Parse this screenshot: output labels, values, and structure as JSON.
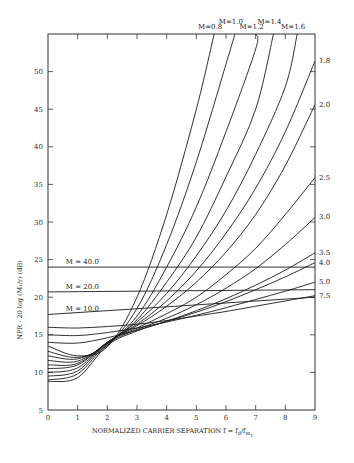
{
  "chart_data": {
    "type": "line",
    "title": "",
    "xlabel": "NORMALIZED CARRIER SEPARATION f = f_d/f_m1",
    "ylabel": "NPR - 20 log (M_1/r) (dB)",
    "xlim": [
      0,
      9
    ],
    "ylim": [
      5,
      55
    ],
    "x_ticks": [
      0,
      1,
      2,
      3,
      4,
      5,
      6,
      7,
      8,
      9
    ],
    "y_ticks": [
      5,
      10,
      15,
      20,
      25,
      30,
      35,
      40,
      45,
      50
    ],
    "grid": false,
    "legend": "inline curve labels",
    "series": [
      {
        "name": "M=0.8",
        "label_pos": "top",
        "x": [
          0,
          1,
          2,
          3,
          4,
          5,
          5.6
        ],
        "y": [
          13.5,
          12.2,
          13.4,
          20,
          31,
          45,
          55
        ]
      },
      {
        "name": "M=1.0",
        "label_pos": "top",
        "x": [
          0,
          1,
          2,
          3,
          4,
          5,
          6,
          6.3
        ],
        "y": [
          12.8,
          12.0,
          13.6,
          18.5,
          27,
          38,
          51,
          55
        ]
      },
      {
        "name": "M=1.2",
        "label_pos": "top",
        "x": [
          0,
          1,
          2,
          3,
          4,
          5,
          6,
          7,
          7.0
        ],
        "y": [
          12.2,
          11.8,
          13.8,
          17.5,
          24,
          32,
          42,
          53,
          55
        ]
      },
      {
        "name": "M=1.4",
        "label_pos": "top",
        "x": [
          0,
          1,
          2,
          3,
          4,
          5,
          6,
          7,
          7.6
        ],
        "y": [
          11.6,
          11.5,
          13.9,
          17,
          22,
          28,
          36,
          45,
          55
        ]
      },
      {
        "name": "M=1.6",
        "label_pos": "top",
        "x": [
          0,
          1,
          2,
          3,
          4,
          5,
          6,
          7,
          8,
          8.4
        ],
        "y": [
          11.0,
          11.2,
          14,
          16.7,
          20.5,
          25.5,
          31.5,
          39,
          48,
          55
        ]
      },
      {
        "name": "1.8",
        "label_pos": "right",
        "x": [
          0,
          1,
          2,
          3,
          4,
          5,
          6,
          7,
          8,
          9
        ],
        "y": [
          10.5,
          11.0,
          14,
          16.4,
          19.5,
          23.5,
          28.5,
          34.5,
          42,
          51.4
        ]
      },
      {
        "name": "2.0",
        "label_pos": "right",
        "x": [
          0,
          1,
          2,
          3,
          4,
          5,
          6,
          7,
          8,
          9
        ],
        "y": [
          10.0,
          10.6,
          14,
          16.2,
          18.8,
          22,
          26,
          31,
          37.5,
          45.6
        ]
      },
      {
        "name": "2.5",
        "label_pos": "right",
        "x": [
          0,
          1,
          2,
          3,
          4,
          5,
          6,
          7,
          8,
          9
        ],
        "y": [
          9.5,
          10.2,
          14,
          15.9,
          17.8,
          20,
          23,
          26.5,
          31,
          35.9
        ]
      },
      {
        "name": "3.0",
        "label_pos": "right",
        "x": [
          0,
          1,
          2,
          3,
          4,
          5,
          6,
          7,
          8,
          9
        ],
        "y": [
          9.0,
          9.8,
          13.8,
          15.7,
          17.2,
          19,
          21.2,
          23.8,
          27,
          30.6
        ]
      },
      {
        "name": "3.5",
        "label_pos": "right",
        "x": [
          0,
          1,
          2,
          3,
          4,
          5,
          6,
          7,
          8,
          9
        ],
        "y": [
          8.8,
          9.3,
          13.6,
          15.5,
          16.8,
          18.2,
          19.8,
          21.6,
          23.6,
          25.9
        ]
      },
      {
        "name": "4.0",
        "label_pos": "right",
        "x": [
          0,
          1,
          2,
          3,
          4,
          5,
          6,
          7,
          8,
          9
        ],
        "y": [
          14.0,
          13.9,
          14.6,
          15.6,
          16.8,
          18.0,
          19.4,
          21.0,
          22.7,
          24.6
        ]
      },
      {
        "name": "5.0",
        "label_pos": "right",
        "x": [
          0,
          1,
          2,
          3,
          4,
          5,
          6,
          7,
          8,
          9
        ],
        "y": [
          15.0,
          14.9,
          15.3,
          15.9,
          16.7,
          17.6,
          18.6,
          19.7,
          20.8,
          22.0
        ]
      },
      {
        "name": "7.5",
        "label_pos": "right",
        "x": [
          0,
          1,
          2,
          3,
          4,
          5,
          6,
          7,
          8,
          9
        ],
        "y": [
          16.0,
          15.9,
          16.1,
          16.4,
          16.9,
          17.5,
          18.1,
          18.8,
          19.5,
          20.2
        ]
      },
      {
        "name": "M = 10.0",
        "label_pos": "inline-left",
        "x": [
          0,
          9
        ],
        "y": [
          17.7,
          20.0
        ]
      },
      {
        "name": "M = 20.0",
        "label_pos": "inline-left",
        "x": [
          0,
          9
        ],
        "y": [
          20.7,
          21.0
        ]
      },
      {
        "name": "M = 40.0",
        "label_pos": "inline-left",
        "x": [
          0,
          9
        ],
        "y": [
          24.0,
          24.0
        ]
      }
    ]
  },
  "labels": {
    "xlabel_main": "NORMALIZED CARRIER SEPARATION f = f",
    "xlabel_sub_d": "d",
    "xlabel_slash": "/f",
    "xlabel_sub_m": "m",
    "xlabel_sub_1": "1",
    "ylabel": "NPR - 20 log (M₁/r) (dB)"
  }
}
